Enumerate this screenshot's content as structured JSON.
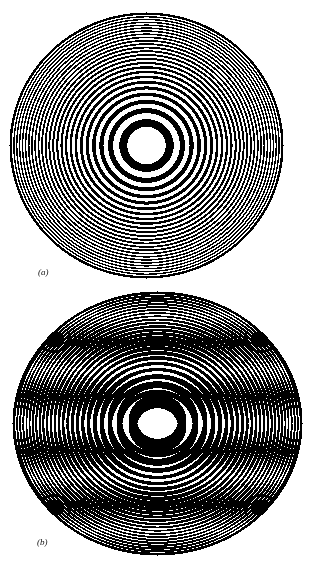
{
  "figure": {
    "background": "#ffffff",
    "ink": "#000000",
    "panels": [
      {
        "id": "a",
        "label": "(a)",
        "label_pos": [
          38,
          267
        ],
        "description": "Fresnel zone plate – concentric alternating black and white rings",
        "center": [
          146,
          145
        ],
        "radii": [
          137,
          133
        ],
        "zone_constant": 370,
        "plates": [
          [
            0,
            0
          ]
        ]
      },
      {
        "id": "b",
        "label": "(b)",
        "label_pos": [
          37,
          537
        ],
        "description": "Moiré pattern from two superimposed, slightly displaced zone plates",
        "center": [
          157,
          423
        ],
        "radii": [
          145,
          132
        ],
        "zone_constant": 370,
        "plates": [
          [
            0,
            -3.2
          ],
          [
            0,
            3.2
          ]
        ]
      }
    ]
  }
}
